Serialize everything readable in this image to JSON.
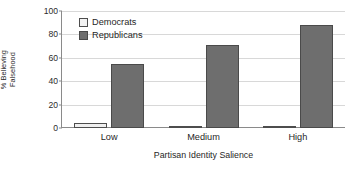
{
  "chart_data": {
    "type": "bar",
    "title": "",
    "xlabel": "Partisan Identity Salience",
    "ylabel": "% Believing Falsehood",
    "ylabel_lines": [
      "% Believing",
      "Falsehood"
    ],
    "categories": [
      "Low",
      "Medium",
      "High"
    ],
    "series": [
      {
        "name": "Democrats",
        "values": [
          4,
          2,
          2
        ],
        "color": "#efefef"
      },
      {
        "name": "Republicans",
        "values": [
          55,
          71,
          88
        ],
        "color": "#6e6e6e"
      }
    ],
    "ylim": [
      0,
      100
    ],
    "yticks": [
      0,
      20,
      40,
      60,
      80,
      100
    ],
    "ytick_labels": [
      "0",
      "20",
      "40",
      "60",
      "80",
      "100"
    ],
    "grid": "horizontal",
    "legend_position": "top-left-inside",
    "axis_color": "#8a8a8a",
    "grid_color": "#d8d8d8"
  },
  "legend": {
    "items": [
      {
        "label": "Democrats"
      },
      {
        "label": "Republicans"
      }
    ]
  }
}
